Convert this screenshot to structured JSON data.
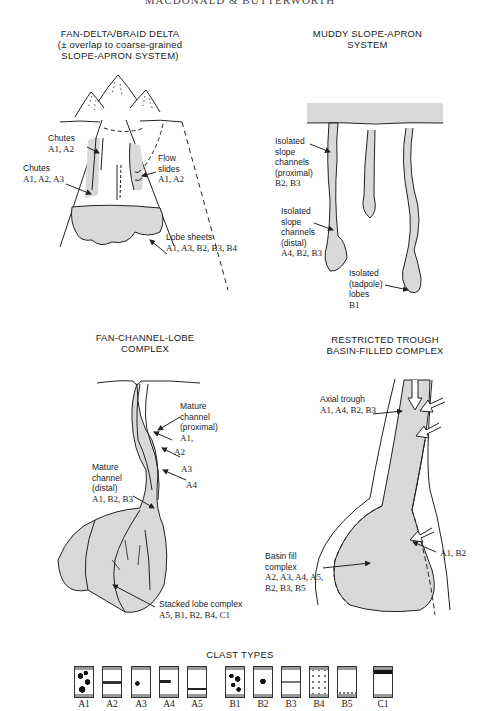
{
  "header": {
    "text": "MACDONALD & BUTTERWORTH"
  },
  "panels": {
    "fan_delta": {
      "title_lines": [
        "FAN-DELTA/BRAID DELTA",
        "(± overlap to coarse-grained",
        "SLOPE-APRON SYSTEM)"
      ],
      "labels": [
        {
          "name": "Chutes",
          "codes": "A1, A2"
        },
        {
          "name": "Chutes",
          "codes": "A1, A2, A3"
        },
        {
          "name": "Flow slides",
          "codes": "A1, A2"
        },
        {
          "name": "Lobe sheets",
          "codes": "A1, A3, B2, B3, B4"
        }
      ]
    },
    "muddy_slope": {
      "title_lines": [
        "MUDDY SLOPE-APRON",
        "SYSTEM"
      ],
      "labels": [
        {
          "name": "Isolated slope channels (proximal)",
          "codes": "B2, B3"
        },
        {
          "name": "Isolated slope channels (distal)",
          "codes": "A4, B2, B3"
        },
        {
          "name": "Isolated (tadpole) lobes",
          "codes": "B1"
        }
      ]
    },
    "fan_channel": {
      "title_lines": [
        "FAN-CHANNEL-LOBE",
        "COMPLEX"
      ],
      "labels": [
        {
          "name": "Mature channel (proximal)",
          "codes": "A1,"
        },
        {
          "name": "",
          "codes": "A2"
        },
        {
          "name": "",
          "codes": "A3"
        },
        {
          "name": "",
          "codes": "A4"
        },
        {
          "name": "Mature channel (distal)",
          "codes": "A1, B2, B3"
        },
        {
          "name": "Stacked lobe complex",
          "codes": "A5, B1, B2, B4, C1"
        }
      ]
    },
    "restricted_trough": {
      "title_lines": [
        "RESTRICTED TROUGH",
        "BASIN-FILLED COMPLEX"
      ],
      "labels": [
        {
          "name": "Axial trough",
          "codes": "A1, A4, B2, B3"
        },
        {
          "name": "",
          "codes": "A1, B2"
        },
        {
          "name": "Basin fill complex",
          "codes": "A2, A3, A4, A5, B2, B3, B5"
        }
      ]
    }
  },
  "clast_types": {
    "title": "CLAST TYPES",
    "items": [
      "A1",
      "A2",
      "A3",
      "A4",
      "A5",
      "B1",
      "B2",
      "B3",
      "B4",
      "B5",
      "C1"
    ]
  },
  "colors": {
    "fill": "#d9d9d9",
    "line": "#222222"
  }
}
